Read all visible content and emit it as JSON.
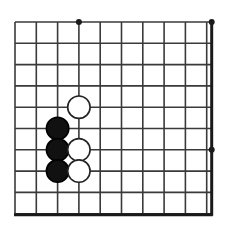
{
  "app": {
    "title": "Go Board Diagram",
    "background_color": "#ffffff"
  },
  "board": {
    "name": "go-board",
    "description": "Partial go board diagram showing a corner fight",
    "visible_columns": 10,
    "visible_rows": 10,
    "line_color": "#3a3a3a",
    "edge_color": "#1a1a1a",
    "grid_spacing_px": 21.3,
    "origin_x_px": 15,
    "origin_y_px": 22,
    "line_width_px": 1.6,
    "edge_line_width_px": 3.0,
    "geometry": {
      "left_px": 15,
      "top_px": 22,
      "right_px": 211.7,
      "bottom_px": 214.7
    },
    "edges": [
      {
        "name": "right-edge",
        "orientation": "vertical",
        "x_px": 211.7,
        "thick": true
      },
      {
        "name": "bottom-edge",
        "orientation": "horizontal",
        "y_px": 214.7,
        "thick": true
      }
    ],
    "star_points": [
      {
        "name": "star-point-top-left",
        "col": 3,
        "row": 0,
        "x_px": 78.9,
        "y_px": 22,
        "radius_px": 3.0
      },
      {
        "name": "star-point-top-right",
        "col": 9,
        "row": 0,
        "x_px": 211.7,
        "y_px": 22,
        "radius_px": 3.0
      },
      {
        "name": "star-point-right",
        "col": 9,
        "row": 6,
        "x_px": 211.7,
        "y_px": 149.8,
        "radius_px": 3.0
      }
    ],
    "stone_radius_px": 11.2,
    "stone_outline_width_px": 1.6,
    "stone_colors": {
      "black_fill": "#111111",
      "black_outline": "#000000",
      "white_fill": "#ffffff",
      "white_outline": "#222222"
    },
    "stones": [
      {
        "name": "stone-white-d5",
        "color": "white",
        "col": 3,
        "row": 4,
        "x_px": 78.9,
        "y_px": 107.2
      },
      {
        "name": "stone-black-c6",
        "color": "black",
        "col": 2,
        "row": 5,
        "x_px": 57.6,
        "y_px": 128.5
      },
      {
        "name": "stone-black-c7",
        "color": "black",
        "col": 2,
        "row": 6,
        "x_px": 57.6,
        "y_px": 149.8
      },
      {
        "name": "stone-white-d7",
        "color": "white",
        "col": 3,
        "row": 6,
        "x_px": 78.9,
        "y_px": 149.8
      },
      {
        "name": "stone-black-c8",
        "color": "black",
        "col": 2,
        "row": 7,
        "x_px": 57.6,
        "y_px": 171.1
      },
      {
        "name": "stone-white-d8",
        "color": "white",
        "col": 3,
        "row": 7,
        "x_px": 78.9,
        "y_px": 171.1
      }
    ],
    "counts": {
      "black_stones": 3,
      "white_stones": 3,
      "total_stones": 6
    }
  }
}
